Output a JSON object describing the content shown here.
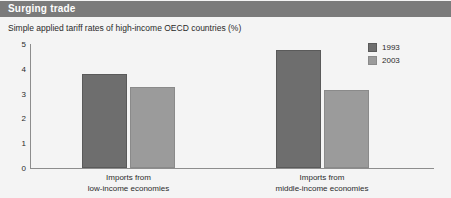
{
  "header": {
    "title": "Surging trade",
    "band_color": "#7b7b7b",
    "title_color": "#ffffff"
  },
  "chart_data": {
    "type": "bar",
    "title": "Surging trade",
    "subtitle": "Simple applied tariff rates of high-income OECD countries (%)",
    "xlabel": "",
    "ylabel": "",
    "ylim": [
      0,
      5
    ],
    "yticks": [
      0,
      1,
      2,
      3,
      4,
      5
    ],
    "ytick_labels": [
      "0",
      "1",
      "2",
      "3",
      "4",
      "5"
    ],
    "grid": false,
    "legend_position": "top-right",
    "categories": [
      "Imports from\nlow-income economies",
      "Imports from\nmiddle-income economies"
    ],
    "category_lines": [
      [
        "Imports from",
        "low-income economies"
      ],
      [
        "Imports from",
        "middle-income economies"
      ]
    ],
    "series": [
      {
        "name": "1993",
        "color": "#6e6e6e",
        "values": [
          3.8,
          4.75
        ]
      },
      {
        "name": "2003",
        "color": "#9b9b9b",
        "values": [
          3.25,
          3.15
        ]
      }
    ]
  },
  "legend": {
    "items": [
      {
        "label": "1993",
        "swatch": "dark"
      },
      {
        "label": "2003",
        "swatch": "light"
      }
    ]
  }
}
